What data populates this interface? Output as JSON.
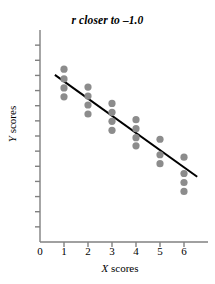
{
  "chart_data": {
    "type": "scatter",
    "title": "r closer to –1.0",
    "xlabel": "X scores",
    "ylabel": "Y scores",
    "x_ticks": [
      "0",
      "1",
      "2",
      "3",
      "4",
      "5",
      "6"
    ],
    "x_tick_values": [
      0,
      1,
      2,
      3,
      4,
      5,
      6
    ],
    "xlim": [
      0,
      7
    ],
    "y_ticks": [
      "",
      "",
      "",
      "",
      "",
      "",
      "",
      "",
      "",
      "",
      "",
      "",
      ""
    ],
    "y_tick_count": 13,
    "ylim": [
      0,
      13
    ],
    "grid": false,
    "legend": null,
    "point_color": "#8c8c8c",
    "line_color": "#000000",
    "axis_color": "#808080",
    "points": [
      {
        "x": 1,
        "y": 10.6
      },
      {
        "x": 1,
        "y": 10.0
      },
      {
        "x": 1,
        "y": 9.45
      },
      {
        "x": 1,
        "y": 8.9
      },
      {
        "x": 2,
        "y": 9.5
      },
      {
        "x": 2,
        "y": 8.95
      },
      {
        "x": 2,
        "y": 8.4
      },
      {
        "x": 2,
        "y": 7.85
      },
      {
        "x": 3,
        "y": 8.5
      },
      {
        "x": 3,
        "y": 7.95
      },
      {
        "x": 3,
        "y": 7.4
      },
      {
        "x": 3,
        "y": 6.85
      },
      {
        "x": 4,
        "y": 7.5
      },
      {
        "x": 4,
        "y": 6.95
      },
      {
        "x": 4,
        "y": 6.4
      },
      {
        "x": 4,
        "y": 5.9
      },
      {
        "x": 5,
        "y": 6.3
      },
      {
        "x": 5,
        "y": 5.35
      },
      {
        "x": 5,
        "y": 4.8
      },
      {
        "x": 6,
        "y": 5.2
      },
      {
        "x": 6,
        "y": 4.2
      },
      {
        "x": 6,
        "y": 3.65
      },
      {
        "x": 6,
        "y": 3.1
      }
    ],
    "regression_line": {
      "x1": 0.62,
      "y1": 10.25,
      "x2": 6.55,
      "y2": 4.0
    }
  },
  "figure": {
    "title": "r closer to –1.0",
    "x_axis_label_var": "X",
    "x_axis_label_rest": " scores",
    "y_axis_label_var": "Y",
    "y_axis_label_rest": " scores"
  }
}
